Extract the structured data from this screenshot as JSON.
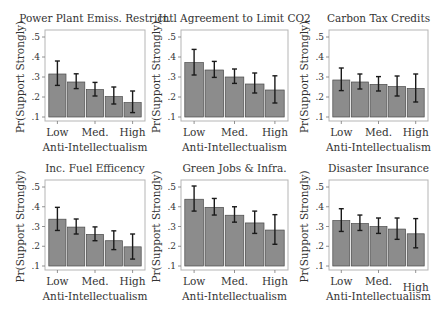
{
  "chart_data": [
    {
      "type": "bar",
      "title": "Power Plant Emiss. Restrict.",
      "xlabel": "Anti-Intellectualism",
      "ylabel": "Pr(Support Strongly)",
      "ylim": [
        0.1,
        0.5
      ],
      "yticks": [
        ".1",
        ".2",
        ".3",
        ".4",
        ".5"
      ],
      "categories": [
        "Low",
        "",
        "Med.",
        "",
        "High"
      ],
      "values": [
        0.315,
        0.275,
        0.237,
        0.202,
        0.172
      ],
      "ci_low": [
        0.258,
        0.242,
        0.205,
        0.165,
        0.122
      ],
      "ci_high": [
        0.38,
        0.316,
        0.273,
        0.25,
        0.23
      ]
    },
    {
      "type": "bar",
      "title": "Intl Agreement to Limit CO2",
      "xlabel": "Anti-Intellectualism",
      "ylabel": "Pr(Support Strongly)",
      "ylim": [
        0.1,
        0.5
      ],
      "yticks": [
        ".1",
        ".2",
        ".3",
        ".4",
        ".5"
      ],
      "categories": [
        "Low",
        "",
        "Med.",
        "",
        "High"
      ],
      "values": [
        0.372,
        0.335,
        0.3,
        0.265,
        0.235
      ],
      "ci_low": [
        0.31,
        0.298,
        0.268,
        0.22,
        0.17
      ],
      "ci_high": [
        0.438,
        0.378,
        0.34,
        0.32,
        0.306
      ]
    },
    {
      "type": "bar",
      "title": "Carbon Tax Credits",
      "xlabel": "Anti-Intellectualism",
      "ylabel": "Pr(Support Strongly)",
      "ylim": [
        0.1,
        0.5
      ],
      "yticks": [
        ".1",
        ".2",
        ".3",
        ".4",
        ".5"
      ],
      "categories": [
        "Low",
        "",
        "Med.",
        "",
        "High"
      ],
      "values": [
        0.285,
        0.275,
        0.263,
        0.252,
        0.243
      ],
      "ci_low": [
        0.232,
        0.24,
        0.23,
        0.205,
        0.175
      ],
      "ci_high": [
        0.345,
        0.315,
        0.302,
        0.305,
        0.315
      ]
    },
    {
      "type": "bar",
      "title": "Inc. Fuel Efficency",
      "xlabel": "Anti-Intellectualism",
      "ylabel": "Pr(Support Strongly)",
      "ylim": [
        0.1,
        0.5
      ],
      "yticks": [
        ".1",
        ".2",
        ".3",
        ".4",
        ".5"
      ],
      "categories": [
        "Low",
        "",
        "Med.",
        "",
        "High"
      ],
      "values": [
        0.337,
        0.297,
        0.26,
        0.228,
        0.197
      ],
      "ci_low": [
        0.28,
        0.262,
        0.228,
        0.183,
        0.135
      ],
      "ci_high": [
        0.397,
        0.338,
        0.298,
        0.278,
        0.262
      ]
    },
    {
      "type": "bar",
      "title": "Green Jobs & Infra.",
      "xlabel": "Anti-Intellectualism",
      "ylabel": "Pr(Support Strongly)",
      "ylim": [
        0.1,
        0.5
      ],
      "yticks": [
        ".1",
        ".2",
        ".3",
        ".4",
        ".5"
      ],
      "categories": [
        "Low",
        "",
        "Med.",
        "",
        "High"
      ],
      "values": [
        0.438,
        0.397,
        0.357,
        0.318,
        0.282
      ],
      "ci_low": [
        0.378,
        0.358,
        0.322,
        0.265,
        0.21
      ],
      "ci_high": [
        0.505,
        0.442,
        0.4,
        0.378,
        0.36
      ]
    },
    {
      "type": "bar",
      "title": "Disaster Insurance",
      "xlabel": "Anti-Intellectualism",
      "ylabel": "Pr(Support Strongly)",
      "ylim": [
        0.1,
        0.5
      ],
      "yticks": [
        ".1",
        ".2",
        ".3",
        ".4",
        ".5"
      ],
      "categories": [
        "Low",
        "",
        "Med.",
        "",
        "High"
      ],
      "values": [
        0.33,
        0.315,
        0.3,
        0.287,
        0.263
      ],
      "ci_low": [
        0.275,
        0.28,
        0.265,
        0.235,
        0.192
      ],
      "ci_high": [
        0.39,
        0.358,
        0.343,
        0.343,
        0.34
      ]
    }
  ],
  "colors": {
    "bar_fill": "#8c8c8c",
    "bar_stroke": "#4a4a4a",
    "error_bar": "#1a1a1a",
    "frame": "#b5b5b5"
  }
}
